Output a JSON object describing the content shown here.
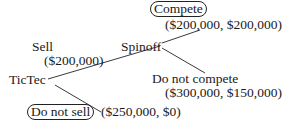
{
  "diagram": {
    "type": "game-tree",
    "nodes": {
      "root": {
        "label": "TicTec"
      },
      "spinoff": {
        "label": "Spinoff"
      }
    },
    "edges": {
      "sell": {
        "label": "Sell",
        "value": "($200,000)"
      },
      "do_not_sell": {
        "label": "Do not sell",
        "payoff": "($250,000, $0)"
      },
      "compete": {
        "label": "Compete",
        "payoff": "($200,000, $200,000)"
      },
      "do_not_compete": {
        "label": "Do not compete",
        "payoff": "($300,000, $150,000)"
      }
    },
    "colors": {
      "line": "#3a3a3a",
      "text": "#1a1a1a",
      "background": "#ffffff"
    }
  }
}
